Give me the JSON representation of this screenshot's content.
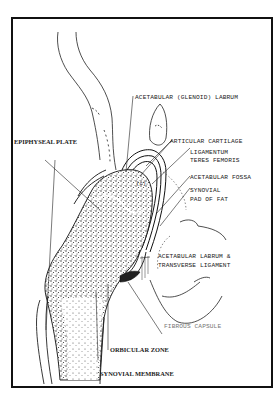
{
  "figure": {
    "stroke_color": "#111111",
    "background": "#ffffff"
  },
  "labels": {
    "acetabular_labrum": "ACETABULAR (GLENOID) LABRUM",
    "epiphyseal_plate": "EPIPHYSEAL PLATE",
    "articular_cartilage": "ARTICULAR CARTILAGE",
    "ligamentum_line1": "LIGAMENTUM",
    "ligamentum_line2": "TERES FEMORIS",
    "acetabular_fossa": "ACETABULAR FOSSA",
    "synovial_pad_line1": "SYNOVIAL",
    "synovial_pad_line2": "PAD OF FAT",
    "labrum_transverse_line1": "ACETABULAR LABRUM &",
    "labrum_transverse_line2": "TRANSVERSE LIGAMENT",
    "fibrous_capsule": "FIBROUS CAPSULE",
    "orbicular_zone": "ORBICULAR ZONE",
    "synovial_membrane": "SYNOVIAL MEMBRANE",
    "head_marker": "(c)"
  }
}
